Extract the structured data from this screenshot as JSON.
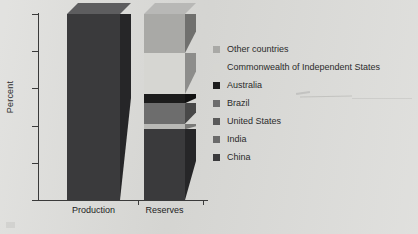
{
  "chart_data": {
    "type": "bar",
    "subtype": "stacked-3d-column",
    "title": "",
    "xlabel": "",
    "ylabel": "Percent",
    "ylim": [
      0,
      100
    ],
    "yticks": [
      0,
      20,
      40,
      60,
      80,
      100
    ],
    "ytick_labels": [
      "0",
      "20",
      "40",
      "60",
      "80",
      "100"
    ],
    "grid": false,
    "legend_position": "right",
    "categories": [
      "Production",
      "Reserves"
    ],
    "series": [
      {
        "name": "China",
        "values": [
          100,
          38
        ],
        "color": "#3a3a3c"
      },
      {
        "name": "India",
        "values": [
          0,
          0
        ],
        "color": "#5e5e60"
      },
      {
        "name": "United States",
        "values": [
          0,
          3
        ],
        "color": "#b9b9b6"
      },
      {
        "name": "Brazil",
        "values": [
          0,
          11
        ],
        "color": "#6d6d6d"
      },
      {
        "name": "Australia",
        "values": [
          0,
          5
        ],
        "color": "#1c1c1c"
      },
      {
        "name": "Commonwealth of Independent States",
        "values": [
          0,
          22
        ],
        "color": "#d6d6d2"
      },
      {
        "name": "Other countries",
        "values": [
          0,
          21
        ],
        "color": "#a9a9a6"
      }
    ]
  },
  "legend": {
    "items": [
      {
        "label": "Other countries",
        "color": "#a9a9a6"
      },
      {
        "label": "Commonwealth of Independent States",
        "color": "#d6d6d2"
      },
      {
        "label": "Australia",
        "color": "#1c1c1c"
      },
      {
        "label": "Brazil",
        "color": "#6d6d6d"
      },
      {
        "label": "United States",
        "color": "#5a5a5a"
      },
      {
        "label": "India",
        "color": "#6a6a6a"
      },
      {
        "label": "China",
        "color": "#3a3a3c"
      }
    ]
  },
  "style": {
    "background": "#d9d9d6",
    "axis_color": "#3a3a3a",
    "text_color": "#2b2b2b"
  }
}
